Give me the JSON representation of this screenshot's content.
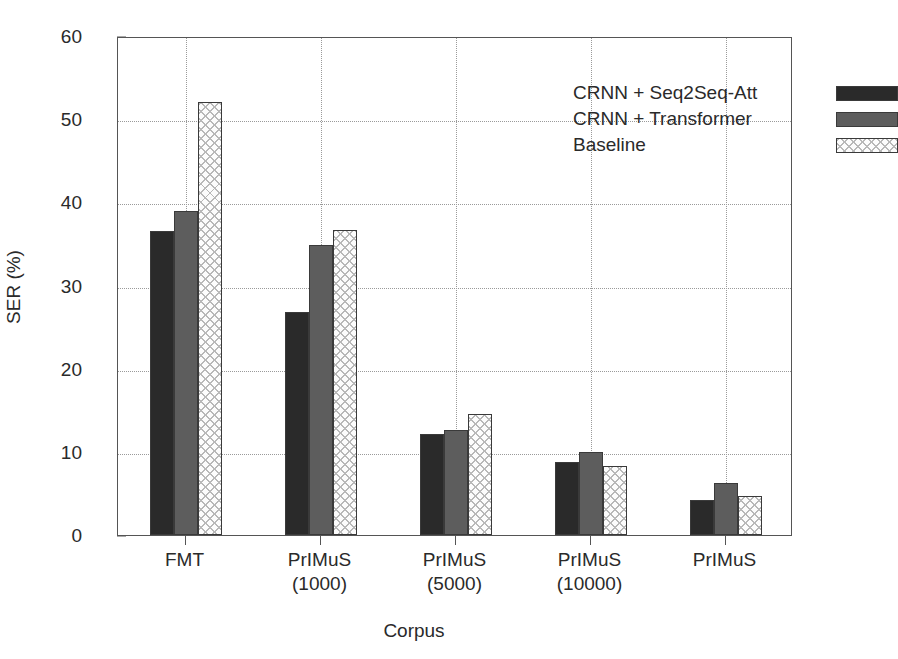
{
  "chart_data": {
    "type": "bar",
    "title": "",
    "xlabel": "Corpus",
    "ylabel": "SER (%)",
    "categories": [
      "FMT",
      "PrIMuS\n(1000)",
      "PrIMuS\n(5000)",
      "PrIMuS\n(10000)",
      "PrIMuS"
    ],
    "category_lines": [
      [
        "FMT"
      ],
      [
        "PrIMuS",
        "(1000)"
      ],
      [
        "PrIMuS",
        "(5000)"
      ],
      [
        "PrIMuS",
        "(10000)"
      ],
      [
        "PrIMuS"
      ]
    ],
    "series": [
      {
        "name": "CRNN + Seq2Seq-Att",
        "values": [
          36.6,
          26.8,
          12.2,
          8.8,
          4.2
        ],
        "color": "#2a2a2a",
        "pattern": "solid-dark"
      },
      {
        "name": "CRNN + Transformer",
        "values": [
          39.0,
          34.9,
          12.6,
          10.0,
          6.2
        ],
        "color": "#5d5d5d",
        "pattern": "solid-gray"
      },
      {
        "name": "Baseline",
        "values": [
          52.1,
          36.7,
          14.6,
          8.3,
          4.7
        ],
        "color": "#fcfcfc",
        "pattern": "cross-hatch"
      }
    ],
    "ylim": [
      0,
      60
    ],
    "yticks": [
      0,
      10,
      20,
      30,
      40,
      50,
      60
    ],
    "ytick_labels": [
      "0",
      "10",
      "20",
      "30",
      "40",
      "50",
      "60"
    ],
    "grid": {
      "horizontal": true,
      "vertical": true,
      "style": "dotted"
    },
    "legend": {
      "position": "top-right",
      "entries": [
        "CRNN + Seq2Seq-Att",
        "CRNN + Transformer",
        "Baseline"
      ]
    }
  }
}
